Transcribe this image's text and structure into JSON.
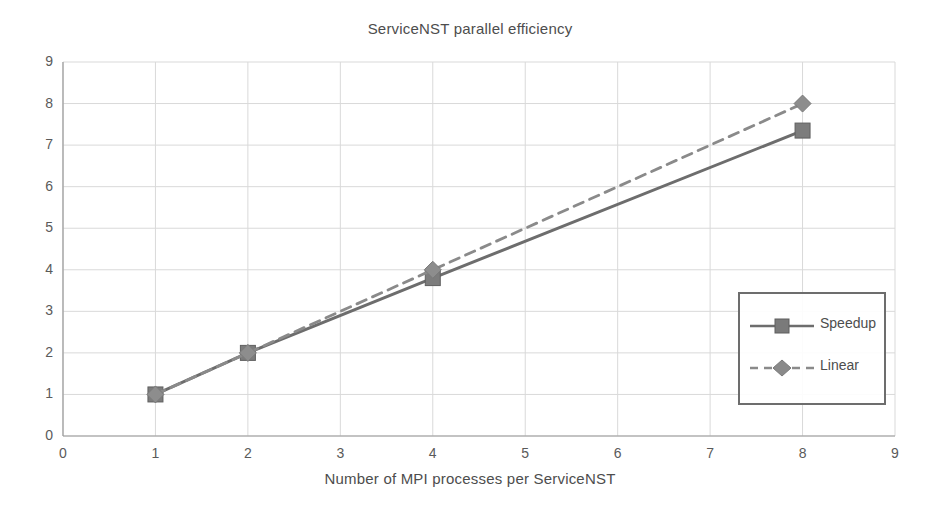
{
  "chart_data": {
    "type": "line",
    "title": "ServiceNST parallel efficiency",
    "xlabel": "Number of MPI processes per ServiceNST",
    "ylabel": "",
    "xlim": [
      0,
      9
    ],
    "ylim": [
      0,
      9
    ],
    "xticks": [
      "0",
      "1",
      "2",
      "3",
      "4",
      "5",
      "6",
      "7",
      "8",
      "9"
    ],
    "yticks": [
      "0",
      "1",
      "2",
      "3",
      "4",
      "5",
      "6",
      "7",
      "8",
      "9"
    ],
    "grid": true,
    "legend_position": "center-right",
    "x": [
      1,
      2,
      4,
      8
    ],
    "series": [
      {
        "name": "Speedup",
        "values": [
          1,
          2,
          3.8,
          7.35
        ],
        "style": "solid",
        "marker": "square",
        "color": "#6d6d6d"
      },
      {
        "name": "Linear",
        "values": [
          1,
          2,
          4,
          8
        ],
        "style": "dashed",
        "marker": "diamond",
        "color": "#8a8a8a"
      }
    ]
  },
  "legend": {
    "items": [
      {
        "label": "Speedup"
      },
      {
        "label": "Linear"
      }
    ]
  },
  "axes": {
    "grid_color": "#d9d9d9",
    "axis_color": "#9a9a9a",
    "text_color": "#4d4d4d"
  }
}
